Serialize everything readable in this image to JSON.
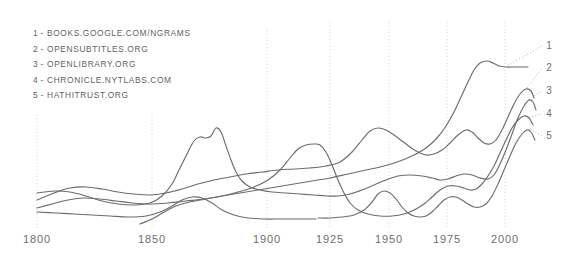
{
  "page": {
    "background_color": "#ffffff",
    "width": 578,
    "height": 253
  },
  "legend": {
    "position": "top-left",
    "items": [
      {
        "number": "1",
        "separator": "-",
        "label": "BOOKS.GOOGLE.COM/NGRAMS"
      },
      {
        "number": "2",
        "separator": "-",
        "label": "OPENSUBTITLES.ORG"
      },
      {
        "number": "3",
        "separator": "-",
        "label": "OPENLIBRARY.ORG"
      },
      {
        "number": "4",
        "separator": "-",
        "label": "CHRONICLE.NYTLABS.COM"
      },
      {
        "number": "5",
        "separator": "-",
        "label": "HATHITRUST.ORG"
      }
    ]
  },
  "end_labels": [
    {
      "id": "1",
      "text": "1"
    },
    {
      "id": "2",
      "text": "2"
    },
    {
      "id": "3",
      "text": "3"
    },
    {
      "id": "4",
      "text": "4"
    },
    {
      "id": "5",
      "text": "5"
    }
  ],
  "colors": {
    "line": "#6c6c6c",
    "gridline": "#cfcfcf",
    "text": "#6d6d6d",
    "legend_text": "#5f5f5f",
    "leader": "#b4b4b4",
    "background": "#ffffff"
  },
  "chart_data": {
    "type": "line",
    "title": "",
    "xlabel": "",
    "ylabel": "",
    "grid": true,
    "legend_position": "top-left",
    "axis_ticks": [
      {
        "label": "1800",
        "x_px": 37
      },
      {
        "label": "1850",
        "x_px": 152
      },
      {
        "label": "1900",
        "x_px": 267
      },
      {
        "label": "1925",
        "x_px": 330
      },
      {
        "label": "1950",
        "x_px": 389
      },
      {
        "label": "1975",
        "x_px": 447
      },
      {
        "label": "2000",
        "x_px": 505
      }
    ],
    "xlim": [
      1800,
      2012
    ],
    "ylim": [
      0,
      100
    ],
    "note": "y values are relative prominence (0-100, unlabeled axis); x positions use the chart's non-uniform tick spacing",
    "series": [
      {
        "name": "BOOKS.GOOGLE.COM/NGRAMS",
        "number": "1",
        "points_px": [
          [
            37,
            208
          ],
          [
            52,
            204
          ],
          [
            68,
            200
          ],
          [
            84,
            198
          ],
          [
            100,
            199
          ],
          [
            116,
            201
          ],
          [
            132,
            203
          ],
          [
            150,
            204
          ],
          [
            168,
            203
          ],
          [
            186,
            201
          ],
          [
            204,
            199
          ],
          [
            222,
            196
          ],
          [
            240,
            193
          ],
          [
            258,
            190
          ],
          [
            276,
            187
          ],
          [
            294,
            184
          ],
          [
            312,
            181
          ],
          [
            330,
            178
          ],
          [
            348,
            174
          ],
          [
            366,
            170
          ],
          [
            384,
            166
          ],
          [
            400,
            161
          ],
          [
            414,
            155
          ],
          [
            426,
            148
          ],
          [
            437,
            138
          ],
          [
            446,
            126
          ],
          [
            454,
            112
          ],
          [
            461,
            97
          ],
          [
            468,
            82
          ],
          [
            474,
            70
          ],
          [
            480,
            63
          ],
          [
            487,
            61
          ],
          [
            493,
            63
          ],
          [
            499,
            66
          ],
          [
            506,
            67
          ],
          [
            514,
            67
          ],
          [
            522,
            67
          ],
          [
            528,
            67
          ]
        ]
      },
      {
        "name": "OPENSUBTITLES.ORG",
        "number": "2",
        "points_px": [
          [
            37,
            200
          ],
          [
            54,
            193
          ],
          [
            70,
            188
          ],
          [
            86,
            187
          ],
          [
            102,
            189
          ],
          [
            118,
            192
          ],
          [
            134,
            194
          ],
          [
            150,
            195
          ],
          [
            166,
            193
          ],
          [
            182,
            189
          ],
          [
            198,
            184
          ],
          [
            214,
            180
          ],
          [
            230,
            177
          ],
          [
            246,
            174
          ],
          [
            262,
            172
          ],
          [
            278,
            170
          ],
          [
            294,
            169
          ],
          [
            310,
            168
          ],
          [
            326,
            166
          ],
          [
            340,
            162
          ],
          [
            352,
            152
          ],
          [
            362,
            140
          ],
          [
            370,
            131
          ],
          [
            378,
            128
          ],
          [
            386,
            130
          ],
          [
            394,
            135
          ],
          [
            402,
            141
          ],
          [
            410,
            147
          ],
          [
            418,
            152
          ],
          [
            426,
            155
          ],
          [
            434,
            154
          ],
          [
            442,
            150
          ],
          [
            450,
            143
          ],
          [
            458,
            135
          ],
          [
            466,
            130
          ],
          [
            472,
            132
          ],
          [
            478,
            138
          ],
          [
            484,
            143
          ],
          [
            490,
            144
          ],
          [
            496,
            140
          ],
          [
            502,
            130
          ],
          [
            508,
            117
          ],
          [
            514,
            104
          ],
          [
            520,
            94
          ],
          [
            526,
            89
          ],
          [
            531,
            91
          ],
          [
            534,
            98
          ]
        ]
      },
      {
        "name": "OPENLIBRARY.ORG",
        "number": "3",
        "points_px": [
          [
            37,
            193
          ],
          [
            54,
            191
          ],
          [
            70,
            192
          ],
          [
            86,
            196
          ],
          [
            102,
            201
          ],
          [
            118,
            204
          ],
          [
            134,
            205
          ],
          [
            150,
            203
          ],
          [
            162,
            196
          ],
          [
            172,
            184
          ],
          [
            180,
            168
          ],
          [
            188,
            152
          ],
          [
            194,
            141
          ],
          [
            200,
            137
          ],
          [
            206,
            138
          ],
          [
            211,
            136
          ],
          [
            216,
            128
          ],
          [
            221,
            132
          ],
          [
            226,
            146
          ],
          [
            231,
            160
          ],
          [
            236,
            172
          ],
          [
            242,
            181
          ],
          [
            250,
            187
          ],
          [
            260,
            190
          ],
          [
            272,
            192
          ],
          [
            286,
            193
          ],
          [
            300,
            194
          ],
          [
            314,
            195
          ],
          [
            326,
            196
          ],
          [
            338,
            196
          ],
          [
            350,
            194
          ],
          [
            362,
            190
          ],
          [
            374,
            185
          ],
          [
            386,
            180
          ],
          [
            398,
            176
          ],
          [
            410,
            175
          ],
          [
            422,
            176
          ],
          [
            432,
            178
          ],
          [
            440,
            180
          ],
          [
            448,
            179
          ],
          [
            456,
            176
          ],
          [
            464,
            174
          ],
          [
            472,
            175
          ],
          [
            480,
            178
          ],
          [
            488,
            179
          ],
          [
            494,
            175
          ],
          [
            500,
            164
          ],
          [
            506,
            150
          ],
          [
            512,
            134
          ],
          [
            518,
            118
          ],
          [
            524,
            106
          ],
          [
            529,
            100
          ],
          [
            533,
            102
          ],
          [
            536,
            110
          ]
        ]
      },
      {
        "name": "CHRONICLE.NYTLABS.COM",
        "number": "4",
        "points_px": [
          [
            140,
            224
          ],
          [
            152,
            219
          ],
          [
            164,
            212
          ],
          [
            176,
            206
          ],
          [
            190,
            202
          ],
          [
            206,
            199
          ],
          [
            222,
            196
          ],
          [
            238,
            192
          ],
          [
            254,
            187
          ],
          [
            268,
            180
          ],
          [
            280,
            170
          ],
          [
            290,
            158
          ],
          [
            298,
            149
          ],
          [
            306,
            145
          ],
          [
            314,
            144
          ],
          [
            320,
            145
          ],
          [
            326,
            152
          ],
          [
            332,
            165
          ],
          [
            338,
            180
          ],
          [
            344,
            193
          ],
          [
            350,
            203
          ],
          [
            358,
            210
          ],
          [
            368,
            214
          ],
          [
            380,
            216
          ],
          [
            392,
            216
          ],
          [
            404,
            214
          ],
          [
            414,
            210
          ],
          [
            424,
            204
          ],
          [
            432,
            197
          ],
          [
            440,
            190
          ],
          [
            448,
            186
          ],
          [
            456,
            186
          ],
          [
            464,
            188
          ],
          [
            470,
            190
          ],
          [
            476,
            189
          ],
          [
            482,
            184
          ],
          [
            488,
            176
          ],
          [
            494,
            166
          ],
          [
            500,
            153
          ],
          [
            506,
            140
          ],
          [
            512,
            128
          ],
          [
            518,
            120
          ],
          [
            524,
            116
          ],
          [
            529,
            118
          ],
          [
            533,
            125
          ]
        ]
      },
      {
        "name": "HATHITRUST.ORG",
        "number": "5",
        "points_px": [
          [
            318,
            218
          ],
          [
            330,
            218
          ],
          [
            342,
            217
          ],
          [
            354,
            215
          ],
          [
            364,
            210
          ],
          [
            372,
            202
          ],
          [
            378,
            194
          ],
          [
            384,
            191
          ],
          [
            390,
            193
          ],
          [
            396,
            199
          ],
          [
            402,
            207
          ],
          [
            408,
            213
          ],
          [
            414,
            216
          ],
          [
            420,
            217
          ],
          [
            426,
            216
          ],
          [
            432,
            212
          ],
          [
            438,
            206
          ],
          [
            444,
            200
          ],
          [
            450,
            197
          ],
          [
            456,
            197
          ],
          [
            462,
            200
          ],
          [
            468,
            204
          ],
          [
            474,
            207
          ],
          [
            480,
            207
          ],
          [
            486,
            204
          ],
          [
            492,
            196
          ],
          [
            498,
            184
          ],
          [
            504,
            170
          ],
          [
            510,
            156
          ],
          [
            516,
            143
          ],
          [
            522,
            134
          ],
          [
            527,
            130
          ],
          [
            531,
            132
          ],
          [
            535,
            140
          ]
        ]
      },
      {
        "name": "secondary-lower-trace",
        "number": "",
        "points_px": [
          [
            37,
            212
          ],
          [
            56,
            213
          ],
          [
            74,
            214
          ],
          [
            92,
            215
          ],
          [
            110,
            216
          ],
          [
            128,
            217
          ],
          [
            146,
            216
          ],
          [
            160,
            212
          ],
          [
            172,
            206
          ],
          [
            182,
            200
          ],
          [
            192,
            197
          ],
          [
            202,
            198
          ],
          [
            212,
            203
          ],
          [
            222,
            210
          ],
          [
            234,
            215
          ],
          [
            248,
            218
          ],
          [
            264,
            219
          ],
          [
            282,
            219
          ],
          [
            300,
            219
          ],
          [
            316,
            219
          ]
        ]
      }
    ]
  }
}
